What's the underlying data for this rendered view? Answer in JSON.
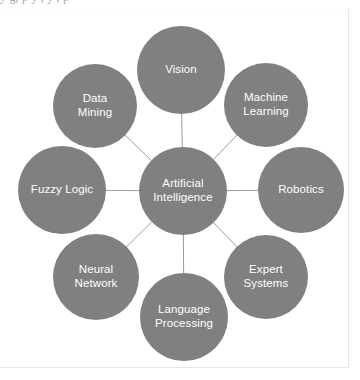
{
  "page": {
    "background_color": "#ffffff",
    "border_color": "#e8e8e8",
    "clipped_top_text": "y  g, p y , y ,   p"
  },
  "diagram": {
    "type": "radial-hub-and-spoke",
    "node_fill_color": "#808080",
    "node_text_color": "#ffffff",
    "link_color": "#9a9a9a",
    "center": {
      "id": "artificial-intelligence",
      "label": "Artificial\nIntelligence",
      "cx": 183,
      "cy": 191,
      "r": 44
    },
    "nodes": [
      {
        "id": "vision",
        "label": "Vision",
        "cx": 181,
        "cy": 70,
        "r": 44
      },
      {
        "id": "machine-learning",
        "label": "Machine\nLearning",
        "cx": 266,
        "cy": 105,
        "r": 42
      },
      {
        "id": "robotics",
        "label": "Robotics",
        "cx": 301,
        "cy": 190,
        "r": 43
      },
      {
        "id": "expert-systems",
        "label": "Expert\nSystems",
        "cx": 266,
        "cy": 277,
        "r": 42
      },
      {
        "id": "language-processing",
        "label": "Language\nProcessing",
        "cx": 184,
        "cy": 317,
        "r": 44
      },
      {
        "id": "neural-network",
        "label": "Neural\nNetwork",
        "cx": 96,
        "cy": 277,
        "r": 43
      },
      {
        "id": "fuzzy-logic",
        "label": "Fuzzy Logic",
        "cx": 62,
        "cy": 190,
        "r": 44
      },
      {
        "id": "data-mining",
        "label": "Data\nMining",
        "cx": 95,
        "cy": 106,
        "r": 42
      }
    ]
  }
}
